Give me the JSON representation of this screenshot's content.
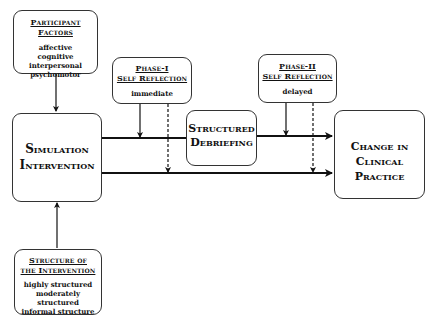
{
  "diagram": {
    "participant_factors": {
      "title": "Participant Factors",
      "items": [
        "affective",
        "cognitive",
        "interpersonal",
        "psychomotor"
      ]
    },
    "phase1": {
      "title_line1": "Phase-I",
      "title_line2": "Self Reflection",
      "timing": "immediate"
    },
    "phase2": {
      "title_line1": "Phase-II",
      "title_line2": "Self Reflection",
      "timing": "delayed"
    },
    "simulation": {
      "line1": "Simulation",
      "line2": "Intervention"
    },
    "debriefing": {
      "line1": "Structured",
      "line2": "Debriefing"
    },
    "outcome": {
      "line1": "Change in",
      "line2": "Clinical Practice"
    },
    "structure": {
      "title_line1": "Structure of",
      "title_line2": "the Intervention",
      "items": [
        "highly structured",
        "moderately structured",
        "informal structure"
      ]
    },
    "colors": {
      "line": "#111111",
      "box_border": "#333333",
      "background": "#ffffff"
    }
  }
}
